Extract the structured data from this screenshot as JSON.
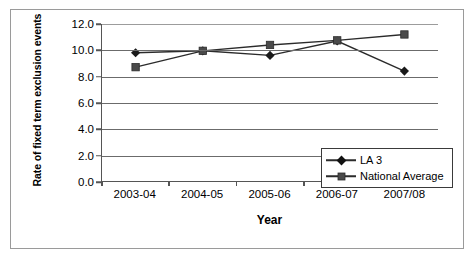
{
  "chart_data": {
    "type": "line",
    "title": "",
    "xlabel": "Year",
    "ylabel": "Rate of fixed term exclusion events",
    "categories": [
      "2003-04",
      "2004-05",
      "2005-06",
      "2006-07",
      "2007/08"
    ],
    "ylim": [
      0.0,
      12.0
    ],
    "yticks": [
      "0.0",
      "2.0",
      "4.0",
      "6.0",
      "8.0",
      "10.0",
      "12.0"
    ],
    "ytick_values": [
      0.0,
      2.0,
      4.0,
      6.0,
      8.0,
      10.0,
      12.0
    ],
    "grid": "horizontal",
    "legend_position": "bottom-right",
    "series": [
      {
        "name": "LA 3",
        "marker": "diamond",
        "color": "#1a1a1a",
        "values": [
          9.8,
          9.95,
          9.6,
          10.7,
          8.4
        ]
      },
      {
        "name": "National Average",
        "marker": "square",
        "color": "#4a4a4a",
        "values": [
          8.7,
          9.95,
          10.4,
          10.75,
          11.2
        ]
      }
    ]
  },
  "legend": {
    "items": [
      {
        "label": "LA 3"
      },
      {
        "label": "National Average"
      }
    ]
  },
  "axes": {
    "x_title": "Year",
    "y_title": "Rate of fixed term exclusion events"
  }
}
